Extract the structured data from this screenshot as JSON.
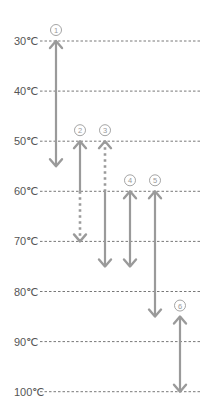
{
  "chart_data": {
    "type": "range-diagram",
    "title": "",
    "axis": {
      "unit": "℃",
      "ticks": [
        "30℃",
        "40℃",
        "50℃",
        "60℃",
        "70℃",
        "80℃",
        "90℃",
        "100℃"
      ],
      "values": [
        30,
        40,
        50,
        60,
        70,
        80,
        90,
        100
      ],
      "direction": "top-to-bottom",
      "grid": "dashed"
    },
    "ranges": [
      {
        "label": "①",
        "from": 30,
        "to": 55,
        "solid_to": 55,
        "dotted": false
      },
      {
        "label": "②",
        "from": 50,
        "to": 70,
        "solid_to": 60,
        "dotted_from": 60,
        "dotted": true
      },
      {
        "label": "③",
        "from": 50,
        "to": 75,
        "dotted_to": 60,
        "solid_from": 60,
        "dotted": true
      },
      {
        "label": "④",
        "from": 60,
        "to": 75,
        "dotted": false
      },
      {
        "label": "⑤",
        "from": 60,
        "to": 85,
        "dotted": false
      },
      {
        "label": "⑥",
        "from": 85,
        "to": 100,
        "dotted": false
      }
    ],
    "colors": {
      "arrow": "#9a9a9a",
      "grid": "#555555",
      "text": "#555555",
      "label": "#9a9a9a"
    }
  }
}
